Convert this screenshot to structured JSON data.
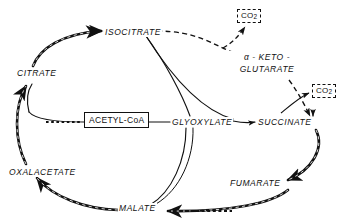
{
  "diagram": {
    "type": "metabolic-pathway-diagram",
    "background_color": "#ffffff",
    "stroke_color": "#111111",
    "nodes": {
      "isocitrate": {
        "label": "ISOCITRATE",
        "x": 104,
        "y": 28
      },
      "citrate": {
        "label": "CITRATE",
        "x": 16,
        "y": 69
      },
      "alpha_keto_glutarate": {
        "line1": "α - KETO -",
        "line2": "GLUTARATE",
        "x": 229,
        "y": 52
      },
      "succinate": {
        "label": "SUCCINATE",
        "x": 257,
        "y": 117
      },
      "fumarate": {
        "label": "FUMARATE",
        "x": 229,
        "y": 178
      },
      "malate": {
        "label": "MALATE",
        "x": 118,
        "y": 203
      },
      "oxalacetate": {
        "label": "OXALACETATE",
        "x": 8,
        "y": 168
      },
      "glyoxylate": {
        "label": "GLYOXYLATE",
        "x": 171,
        "y": 118
      },
      "acetyl_coa": {
        "label": "ACETYL-CoA",
        "x": 84,
        "y": 112
      },
      "co2_top": {
        "label": "CO",
        "subscript": "2",
        "x": 237,
        "y": 9
      },
      "co2_right": {
        "label": "CO",
        "subscript": "2",
        "x": 312,
        "y": 84
      }
    },
    "paths": {
      "tca_cycle_name": "citric-acid-cycle-outer-loop",
      "glyoxylate_shunt_name": "glyoxylate-shunt-inner-paths"
    }
  }
}
